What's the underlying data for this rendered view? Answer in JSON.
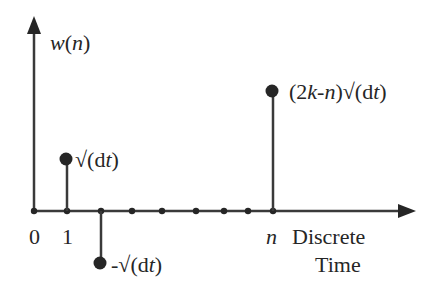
{
  "diagram": {
    "y_axis_label": {
      "prefix": "w(",
      "var": "n",
      "suffix": ")"
    },
    "x_axis_label_line1": "Discrete",
    "x_axis_label_line2": "Time",
    "tick_labels": {
      "zero": "0",
      "one": "1",
      "n": "n"
    },
    "stems": [
      {
        "position": "1",
        "label_pre": "√(d",
        "label_var": "t",
        "label_post": ")",
        "direction": "up"
      },
      {
        "position": "2",
        "label_pre": "-√(d",
        "label_var": "t",
        "label_post": ")",
        "direction": "down"
      },
      {
        "position": "n",
        "label_pre": "(2",
        "label_k": "k",
        "label_mid": "-",
        "label_n": "n",
        "label_post": ")√(d",
        "label_var": "t",
        "label_end": ")",
        "direction": "up"
      }
    ],
    "colors": {
      "ink": "#262626",
      "background": "#ffffff"
    }
  }
}
